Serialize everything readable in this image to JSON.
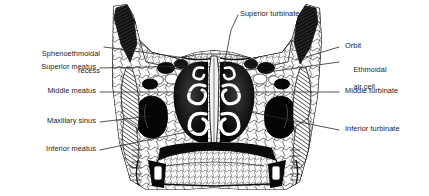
{
  "figure": {
    "background_color": "#ffffff",
    "ink_color": "#1c1c1c",
    "leader_color": "#2a2a2a"
  },
  "labels": {
    "sphenoethmoidal_recess_line1": "Sphenoethmoidal",
    "sphenoethmoidal_recess_line2": "recess",
    "superior_meatus": "Superior meatus",
    "middle_meatus": "Middle meatus",
    "maxillary_sinus": "Maxillary sinus",
    "inferior_meatus": "Inferior meatus",
    "superior_turbinate": "Superior turbinate",
    "orbit": "Orbit",
    "ethmoidal_air_cell_line1": "Ethmoidal",
    "ethmoidal_air_cell_line2": "air cell",
    "middle_turbinate": "Middle turbinate",
    "inferior_turbinate": "Inferior turbinate"
  }
}
